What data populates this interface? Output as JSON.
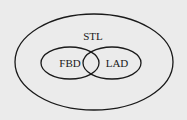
{
  "diagram": {
    "type": "venn",
    "outer": {
      "label": "STL"
    },
    "inner_left": {
      "label": "FBD"
    },
    "inner_right": {
      "label": "LAD"
    },
    "stroke_color": "#1a1a1a",
    "background": "#ebebeb"
  }
}
